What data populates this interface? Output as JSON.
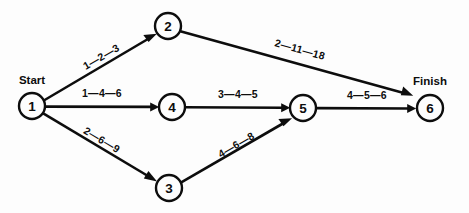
{
  "diagram": {
    "type": "network-diagram",
    "start_label": "Start",
    "finish_label": "Finish",
    "colors": {
      "background": "#fdfdfd",
      "line": "#0d0d0d",
      "node_fill": "#fdfdfd"
    },
    "nodes": [
      {
        "id": "1",
        "label": "1",
        "cx": 32,
        "cy": 106,
        "r": 13
      },
      {
        "id": "2",
        "label": "2",
        "cx": 168,
        "cy": 26,
        "r": 13
      },
      {
        "id": "3",
        "label": "3",
        "cx": 169,
        "cy": 188,
        "r": 13
      },
      {
        "id": "4",
        "label": "4",
        "cx": 172,
        "cy": 107,
        "r": 13
      },
      {
        "id": "5",
        "label": "5",
        "cx": 303,
        "cy": 108,
        "r": 13
      },
      {
        "id": "6",
        "label": "6",
        "cx": 430,
        "cy": 108,
        "r": 13
      }
    ],
    "edges": [
      {
        "id": "e1-2",
        "from": "1",
        "to": "2",
        "label": "1—2—3",
        "optimistic": 1,
        "most_likely": 2,
        "pessimistic": 3,
        "label_x": 103,
        "label_y": 60,
        "label_rot": -30
      },
      {
        "id": "e1-4",
        "from": "1",
        "to": "4",
        "label": "1—4—6",
        "optimistic": 1,
        "most_likely": 4,
        "pessimistic": 6,
        "label_x": 102,
        "label_y": 97,
        "label_rot": 0
      },
      {
        "id": "e1-3",
        "from": "1",
        "to": "3",
        "label": "2—6—9",
        "optimistic": 2,
        "most_likely": 6,
        "pessimistic": 9,
        "label_x": 100,
        "label_y": 143,
        "label_rot": 31
      },
      {
        "id": "e2-6",
        "from": "2",
        "to": "6",
        "label": "2—11—18",
        "optimistic": 2,
        "most_likely": 11,
        "pessimistic": 18,
        "label_x": 299,
        "label_y": 53,
        "label_rot": 19
      },
      {
        "id": "e4-5",
        "from": "4",
        "to": "5",
        "label": "3—4—5",
        "optimistic": 3,
        "most_likely": 4,
        "pessimistic": 5,
        "label_x": 238,
        "label_y": 98,
        "label_rot": 0
      },
      {
        "id": "e3-5",
        "from": "3",
        "to": "5",
        "label": "4—6—8",
        "optimistic": 4,
        "most_likely": 6,
        "pessimistic": 8,
        "label_x": 238,
        "label_y": 148,
        "label_rot": -30
      },
      {
        "id": "e5-6",
        "from": "5",
        "to": "6",
        "label": "4—5—6",
        "optimistic": 4,
        "most_likely": 5,
        "pessimistic": 6,
        "label_x": 367,
        "label_y": 99,
        "label_rot": 0
      }
    ],
    "terminal_labels": [
      {
        "id": "start",
        "text": "Start",
        "x": 32,
        "y": 84
      },
      {
        "id": "finish",
        "text": "Finish",
        "x": 430,
        "y": 85
      }
    ]
  }
}
